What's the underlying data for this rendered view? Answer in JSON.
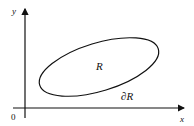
{
  "diagram": {
    "axes": {
      "x_label": "x",
      "y_label": "y",
      "origin_label": "0"
    },
    "region": {
      "interior_label": "R",
      "boundary_label": "∂R"
    },
    "colors": {
      "stroke": "#111111",
      "background": "#ffffff"
    }
  }
}
